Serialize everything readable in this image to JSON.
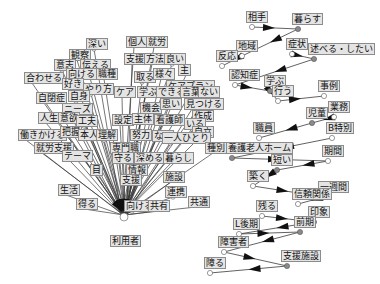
{
  "diagram": {
    "type": "co-occurrence-network",
    "hub": {
      "id": "riyousha",
      "label": "利用者",
      "x": 124,
      "y": 231
    },
    "hub_cluster": {
      "labels": [
        {
          "text": "深い",
          "x": 86,
          "y": 44
        },
        {
          "text": "個人",
          "x": 126,
          "y": 42
        },
        {
          "text": "就労",
          "x": 146,
          "y": 42
        },
        {
          "text": "観察",
          "x": 69,
          "y": 55
        },
        {
          "text": "意志",
          "x": 54,
          "y": 65
        },
        {
          "text": "伝える",
          "x": 80,
          "y": 65
        },
        {
          "text": "支援",
          "x": 124,
          "y": 59
        },
        {
          "text": "方法",
          "x": 144,
          "y": 59
        },
        {
          "text": "良い",
          "x": 164,
          "y": 59
        },
        {
          "text": "合わせる",
          "x": 24,
          "y": 78
        },
        {
          "text": "向ける",
          "x": 66,
          "y": 74
        },
        {
          "text": "職種",
          "x": 96,
          "y": 74
        },
        {
          "text": "取る",
          "x": 134,
          "y": 77
        },
        {
          "text": "様々",
          "x": 153,
          "y": 74
        },
        {
          "text": "主",
          "x": 178,
          "y": 70
        },
        {
          "text": "好き",
          "x": 62,
          "y": 84
        },
        {
          "text": "やり方",
          "x": 83,
          "y": 89
        },
        {
          "text": "ケアプラン",
          "x": 166,
          "y": 86
        },
        {
          "text": "ケア",
          "x": 114,
          "y": 92
        },
        {
          "text": "学ぶ",
          "x": 137,
          "y": 92
        },
        {
          "text": "できる",
          "x": 156,
          "y": 92
        },
        {
          "text": "言葉",
          "x": 180,
          "y": 92
        },
        {
          "text": "ない",
          "x": 198,
          "y": 92
        },
        {
          "text": "自閉症",
          "x": 36,
          "y": 98
        },
        {
          "text": "自身",
          "x": 68,
          "y": 96
        },
        {
          "text": "機会",
          "x": 140,
          "y": 108
        },
        {
          "text": "思い",
          "x": 160,
          "y": 104
        },
        {
          "text": "見つける",
          "x": 184,
          "y": 104
        },
        {
          "text": "ニーズ",
          "x": 62,
          "y": 109
        },
        {
          "text": "作成",
          "x": 192,
          "y": 116
        },
        {
          "text": "人生",
          "x": 38,
          "y": 118
        },
        {
          "text": "意欲",
          "x": 58,
          "y": 118
        },
        {
          "text": "工夫",
          "x": 76,
          "y": 121
        },
        {
          "text": "設定",
          "x": 112,
          "y": 120
        },
        {
          "text": "主体",
          "x": 132,
          "y": 119
        },
        {
          "text": "看護師",
          "x": 154,
          "y": 120
        },
        {
          "text": "いる",
          "x": 184,
          "y": 124
        },
        {
          "text": "働きかける",
          "x": 18,
          "y": 135
        },
        {
          "text": "把握",
          "x": 60,
          "y": 132
        },
        {
          "text": "本人",
          "x": 78,
          "y": 135
        },
        {
          "text": "理解",
          "x": 96,
          "y": 135
        },
        {
          "text": "努力",
          "x": 130,
          "y": 135
        },
        {
          "text": "なる",
          "x": 152,
          "y": 136
        },
        {
          "text": "自立",
          "x": 192,
          "y": 132
        },
        {
          "text": "一人ひとり",
          "x": 162,
          "y": 138
        },
        {
          "text": "就労支援",
          "x": 34,
          "y": 148
        },
        {
          "text": "専門職",
          "x": 110,
          "y": 148
        },
        {
          "text": "守る",
          "x": 112,
          "y": 158
        },
        {
          "text": "深める",
          "x": 134,
          "y": 158
        },
        {
          "text": "暮らし",
          "x": 163,
          "y": 158
        },
        {
          "text": "テーマ",
          "x": 62,
          "y": 156
        },
        {
          "text": "種別",
          "x": 205,
          "y": 148
        },
        {
          "text": "目",
          "x": 90,
          "y": 170
        },
        {
          "text": "情報",
          "x": 126,
          "y": 170
        },
        {
          "text": "施設",
          "x": 163,
          "y": 177
        },
        {
          "text": "支援",
          "x": 120,
          "y": 180
        },
        {
          "text": "連携",
          "x": 165,
          "y": 192
        },
        {
          "text": "生活",
          "x": 58,
          "y": 190
        },
        {
          "text": "共通",
          "x": 188,
          "y": 202
        },
        {
          "text": "得る",
          "x": 76,
          "y": 204
        },
        {
          "text": "向ける",
          "x": 124,
          "y": 206
        },
        {
          "text": "共有",
          "x": 148,
          "y": 206
        }
      ]
    },
    "right_clusters": [
      {
        "name": "community",
        "nodes": [
          {
            "text": "相手",
            "x": 246,
            "y": 17
          },
          {
            "text": "暮らす",
            "x": 292,
            "y": 19
          },
          {
            "text": "地域",
            "x": 236,
            "y": 46
          },
          {
            "text": "反応",
            "x": 216,
            "y": 56
          }
        ]
      },
      {
        "name": "learning",
        "nodes": [
          {
            "text": "症状",
            "x": 286,
            "y": 44
          },
          {
            "text": "述べる・したい",
            "x": 308,
            "y": 49
          },
          {
            "text": "認知症",
            "x": 229,
            "y": 75
          },
          {
            "text": "学ぶ",
            "x": 264,
            "y": 81
          },
          {
            "text": "行う",
            "x": 272,
            "y": 91
          },
          {
            "text": "事例",
            "x": 318,
            "y": 86
          }
        ]
      },
      {
        "name": "children",
        "nodes": [
          {
            "text": "業務",
            "x": 328,
            "y": 107
          },
          {
            "text": "児童",
            "x": 306,
            "y": 113
          },
          {
            "text": "職員",
            "x": 253,
            "y": 128
          }
        ]
      },
      {
        "name": "elderly-home",
        "nodes": [
          {
            "text": "B特別",
            "x": 326,
            "y": 128
          },
          {
            "text": "養護老人ホーム",
            "x": 226,
            "y": 148
          },
          {
            "text": "期間",
            "x": 322,
            "y": 151
          },
          {
            "text": "短い",
            "x": 271,
            "y": 160
          },
          {
            "text": "築く",
            "x": 247,
            "y": 176
          },
          {
            "text": "一週間",
            "x": 318,
            "y": 187
          },
          {
            "text": "信頼関係",
            "x": 292,
            "y": 194
          }
        ]
      },
      {
        "name": "facility",
        "nodes": [
          {
            "text": "残る",
            "x": 256,
            "y": 206
          },
          {
            "text": "印象",
            "x": 308,
            "y": 212
          },
          {
            "text": "L後期",
            "x": 233,
            "y": 224
          },
          {
            "text": "前期",
            "x": 294,
            "y": 222
          },
          {
            "text": "障害者",
            "x": 218,
            "y": 242
          },
          {
            "text": "支援施設",
            "x": 281,
            "y": 256
          },
          {
            "text": "障る",
            "x": 204,
            "y": 263
          }
        ]
      }
    ],
    "colors": {
      "label_bg": "#e4e4e4",
      "label_border": "#8c8c8c",
      "edge": "#3a3a3a",
      "node_white": "#ffffff",
      "node_gray": "#8a8a8a"
    }
  }
}
